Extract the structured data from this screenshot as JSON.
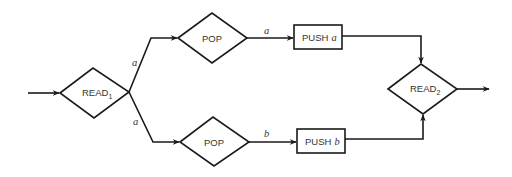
{
  "diagram": {
    "nodes": {
      "read1": {
        "label": "READ",
        "subscript": "1",
        "shape": "diamond"
      },
      "pop_top": {
        "label": "POP",
        "shape": "diamond"
      },
      "pop_bottom": {
        "label": "POP",
        "shape": "diamond"
      },
      "push_a": {
        "label": "PUSH",
        "var": "a",
        "shape": "rectangle"
      },
      "push_b": {
        "label": "PUSH",
        "var": "b",
        "shape": "rectangle"
      },
      "read2": {
        "label": "READ",
        "subscript": "2",
        "shape": "diamond"
      }
    },
    "edges": {
      "read1_to_pop_top": {
        "label": "a"
      },
      "read1_to_pop_bottom": {
        "label": "a"
      },
      "pop_top_to_push_a": {
        "label": "a"
      },
      "pop_bottom_to_push_b": {
        "label": "b"
      }
    },
    "colors": {
      "stroke": "#1a1a1a",
      "text": "#333333",
      "background": "#ffffff"
    }
  }
}
